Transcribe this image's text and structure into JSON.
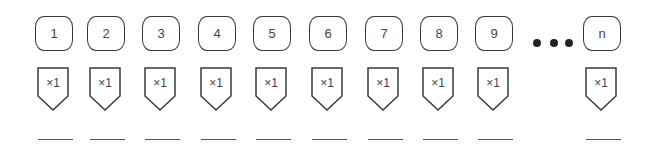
{
  "boxes": [
    {
      "label": "1",
      "multiplier": "×1"
    },
    {
      "label": "2",
      "multiplier": "×1"
    },
    {
      "label": "3",
      "multiplier": "×1"
    },
    {
      "label": "4",
      "multiplier": "×1"
    },
    {
      "label": "5",
      "multiplier": "×1"
    },
    {
      "label": "6",
      "multiplier": "×1"
    },
    {
      "label": "7",
      "multiplier": "×1"
    },
    {
      "label": "8",
      "multiplier": "×1"
    },
    {
      "label": "9",
      "multiplier": "×1"
    },
    {
      "label": "n",
      "multiplier": "×1"
    }
  ],
  "ellipsis": "•••",
  "colors": {
    "stroke": "#3a3a3a",
    "dots": "#222222",
    "background": "#ffffff"
  }
}
